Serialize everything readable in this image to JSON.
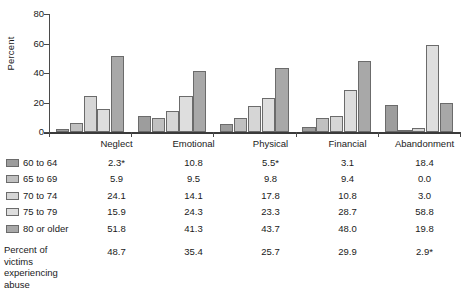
{
  "chart_data": {
    "type": "bar",
    "title": "",
    "xlabel": "",
    "ylabel": "Percent",
    "ylim": [
      0,
      80
    ],
    "yticks": [
      0,
      20,
      40,
      60,
      80
    ],
    "grid": false,
    "legend_position": "below-table-left",
    "categories": [
      "Neglect",
      "Emotional",
      "Physical",
      "Financial",
      "Abandonment"
    ],
    "series": [
      {
        "name": "60 to 64",
        "values": [
          2.3,
          10.8,
          5.5,
          3.1,
          18.4
        ],
        "labels": [
          "2.3*",
          "10.8",
          "5.5*",
          "3.1",
          "18.4"
        ]
      },
      {
        "name": "65 to 69",
        "values": [
          5.9,
          9.5,
          9.8,
          9.4,
          0.0
        ],
        "labels": [
          "5.9",
          "9.5",
          "9.8",
          "9.4",
          "0.0"
        ]
      },
      {
        "name": "70 to 74",
        "values": [
          24.1,
          14.1,
          17.8,
          10.8,
          3.0
        ],
        "labels": [
          "24.1",
          "14.1",
          "17.8",
          "10.8",
          "3.0"
        ]
      },
      {
        "name": "75 to 79",
        "values": [
          15.9,
          24.3,
          23.3,
          28.7,
          58.8
        ],
        "labels": [
          "15.9",
          "24.3",
          "23.3",
          "28.7",
          "58.8"
        ]
      },
      {
        "name": "80 or older",
        "values": [
          51.8,
          41.3,
          43.7,
          48.0,
          19.8
        ],
        "labels": [
          "51.8",
          "41.3",
          "43.7",
          "48.0",
          "19.8"
        ]
      }
    ],
    "footer": {
      "label_lines": [
        "Percent of victims",
        "experiencing",
        "abuse"
      ],
      "values": [
        48.7,
        35.4,
        25.7,
        29.9,
        2.9
      ],
      "labels": [
        "48.7",
        "35.4",
        "25.7",
        "29.9",
        "2.9*"
      ]
    },
    "series_colors": [
      "#9d9d9d",
      "#c0c0c0",
      "#d6d6d6",
      "#dedede",
      "#a8a8a8"
    ]
  },
  "axis": {
    "ylabel": "Percent",
    "ytick_labels": [
      "80",
      "60",
      "40",
      "20",
      "0"
    ]
  },
  "table": {
    "corner_label": "",
    "headers": [
      "Neglect",
      "Emotional",
      "Physical",
      "Financial",
      "Abandonment"
    ],
    "rows": [
      {
        "label": "60 to 64",
        "cells": [
          "2.3*",
          "10.8",
          "5.5*",
          "3.1",
          "18.4"
        ]
      },
      {
        "label": "65 to 69",
        "cells": [
          "5.9",
          "9.5",
          "9.8",
          "9.4",
          "0.0"
        ]
      },
      {
        "label": "70 to 74",
        "cells": [
          "24.1",
          "14.1",
          "17.8",
          "10.8",
          "3.0"
        ]
      },
      {
        "label": "75 to 79",
        "cells": [
          "15.9",
          "24.3",
          "23.3",
          "28.7",
          "58.8"
        ]
      },
      {
        "label": "80 or older",
        "cells": [
          "51.8",
          "41.3",
          "43.7",
          "48.0",
          "19.8"
        ]
      }
    ],
    "footer": {
      "line1": "Percent of victims",
      "line2": "experiencing",
      "line3": "abuse",
      "cells": [
        "48.7",
        "35.4",
        "25.7",
        "29.9",
        "2.9*"
      ]
    }
  }
}
